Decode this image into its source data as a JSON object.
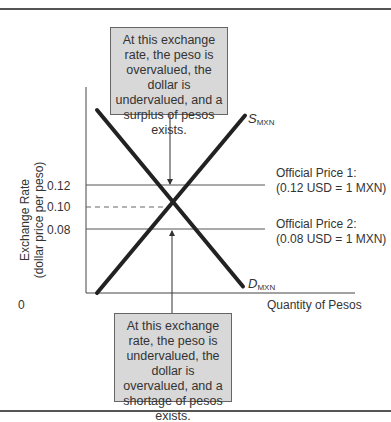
{
  "chart_data": {
    "type": "line",
    "title": "",
    "xlabel": "Quantity of Pesos",
    "ylabel_line1": "Exchange Rate",
    "ylabel_line2": "(dollar price per peso)",
    "origin_label": "0",
    "y_ticks": [
      {
        "value": 0.12,
        "label": "0.12"
      },
      {
        "value": 0.1,
        "label": "0.10"
      },
      {
        "value": 0.08,
        "label": "0.08"
      }
    ],
    "ylim": [
      0.0,
      0.2
    ],
    "xlim": [
      0,
      10
    ],
    "equilibrium": {
      "x": 5,
      "y": 0.1
    },
    "series": [
      {
        "name": "S_MXN",
        "label_main": "S",
        "label_sub": "MXN",
        "points": [
          [
            1,
            0.02
          ],
          [
            9.5,
            0.185
          ]
        ]
      },
      {
        "name": "D_MXN",
        "label_main": "D",
        "label_sub": "MXN",
        "points": [
          [
            0.5,
            0.19
          ],
          [
            9.0,
            0.025
          ]
        ]
      }
    ],
    "hlines": [
      {
        "y": 0.12,
        "name": "Official Price 1",
        "label1": "Official Price 1:",
        "label2": "(0.12 USD = 1 MXN)"
      },
      {
        "y": 0.08,
        "name": "Official Price 2",
        "label1": "Official Price 2:",
        "label2": "(0.08 USD = 1 MXN)"
      }
    ],
    "annotations": [
      {
        "position": "top",
        "text": "At this exchange rate, the peso is overvalued, the dollar is undervalued, and a surplus of pesos exists.",
        "points_to_y": 0.12
      },
      {
        "position": "bottom",
        "text": "At this exchange rate, the peso is undervalued, the dollar is overvalued, and a shortage of pesos exists.",
        "points_to_y": 0.08
      }
    ]
  }
}
